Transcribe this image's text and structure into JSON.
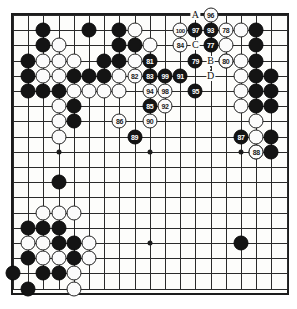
{
  "diagram": {
    "type": "go-board",
    "size": 19,
    "move_range": "67-100",
    "colors": {
      "black_stone": "#141414",
      "white_stone": "#fbfbfb",
      "grid_line": "#2a2a2a",
      "board_background": "#fdfdfb",
      "border": "#1c1c1c"
    }
  },
  "grid": {
    "origin_x": 13,
    "origin_y": 15,
    "spacing": 15.2,
    "star_points": [
      {
        "col": 3,
        "row": 3
      },
      {
        "col": 9,
        "row": 3
      },
      {
        "col": 15,
        "row": 3
      },
      {
        "col": 3,
        "row": 9
      },
      {
        "col": 9,
        "row": 9
      },
      {
        "col": 15,
        "row": 9
      },
      {
        "col": 3,
        "row": 15
      },
      {
        "col": 9,
        "row": 15
      },
      {
        "col": 15,
        "row": 15
      }
    ]
  },
  "stones": [
    {
      "col": 7,
      "row": 1,
      "color": "black"
    },
    {
      "col": 8,
      "row": 1,
      "color": "white"
    },
    {
      "col": 2,
      "row": 1,
      "color": "black"
    },
    {
      "col": 16,
      "row": 1,
      "color": "black"
    },
    {
      "col": 15,
      "row": 1,
      "color": "white"
    },
    {
      "col": 5,
      "row": 1,
      "color": "black"
    },
    {
      "col": 7,
      "row": 2,
      "color": "black"
    },
    {
      "col": 8,
      "row": 2,
      "color": "black"
    },
    {
      "col": 2,
      "row": 2,
      "color": "black"
    },
    {
      "col": 3,
      "row": 2,
      "color": "white"
    },
    {
      "col": 9,
      "row": 2,
      "color": "white"
    },
    {
      "col": 16,
      "row": 2,
      "color": "black"
    },
    {
      "col": 1,
      "row": 3,
      "color": "black"
    },
    {
      "col": 2,
      "row": 3,
      "color": "white"
    },
    {
      "col": 3,
      "row": 3,
      "color": "white"
    },
    {
      "col": 4,
      "row": 3,
      "color": "white"
    },
    {
      "col": 6,
      "row": 3,
      "color": "black"
    },
    {
      "col": 7,
      "row": 3,
      "color": "black"
    },
    {
      "col": 8,
      "row": 3,
      "color": "white"
    },
    {
      "col": 16,
      "row": 3,
      "color": "black"
    },
    {
      "col": 15,
      "row": 3,
      "color": "white"
    },
    {
      "col": 1,
      "row": 4,
      "color": "black"
    },
    {
      "col": 2,
      "row": 4,
      "color": "white"
    },
    {
      "col": 3,
      "row": 4,
      "color": "white"
    },
    {
      "col": 4,
      "row": 4,
      "color": "black"
    },
    {
      "col": 5,
      "row": 4,
      "color": "black"
    },
    {
      "col": 6,
      "row": 4,
      "color": "black"
    },
    {
      "col": 7,
      "row": 4,
      "color": "white"
    },
    {
      "col": 15,
      "row": 4,
      "color": "white"
    },
    {
      "col": 16,
      "row": 4,
      "color": "black"
    },
    {
      "col": 1,
      "row": 5,
      "color": "black"
    },
    {
      "col": 2,
      "row": 5,
      "color": "black"
    },
    {
      "col": 3,
      "row": 5,
      "color": "black"
    },
    {
      "col": 4,
      "row": 5,
      "color": "white"
    },
    {
      "col": 5,
      "row": 5,
      "color": "white"
    },
    {
      "col": 6,
      "row": 5,
      "color": "white"
    },
    {
      "col": 7,
      "row": 5,
      "color": "white"
    },
    {
      "col": 15,
      "row": 5,
      "color": "white"
    },
    {
      "col": 16,
      "row": 5,
      "color": "black"
    },
    {
      "col": 3,
      "row": 6,
      "color": "white"
    },
    {
      "col": 4,
      "row": 6,
      "color": "black"
    },
    {
      "col": 15,
      "row": 6,
      "color": "white"
    },
    {
      "col": 16,
      "row": 6,
      "color": "black"
    },
    {
      "col": 3,
      "row": 7,
      "color": "white"
    },
    {
      "col": 4,
      "row": 7,
      "color": "black"
    },
    {
      "col": 3,
      "row": 8,
      "color": "white"
    },
    {
      "col": 16,
      "row": 8,
      "color": "white"
    },
    {
      "col": 17,
      "row": 8,
      "color": "black"
    },
    {
      "col": 3,
      "row": 11,
      "color": "black"
    },
    {
      "col": 2,
      "row": 13,
      "color": "white"
    },
    {
      "col": 3,
      "row": 13,
      "color": "white"
    },
    {
      "col": 4,
      "row": 13,
      "color": "white"
    },
    {
      "col": 1,
      "row": 14,
      "color": "black"
    },
    {
      "col": 2,
      "row": 14,
      "color": "black"
    },
    {
      "col": 3,
      "row": 14,
      "color": "black"
    },
    {
      "col": 1,
      "row": 15,
      "color": "white"
    },
    {
      "col": 2,
      "row": 15,
      "color": "white"
    },
    {
      "col": 3,
      "row": 15,
      "color": "black"
    },
    {
      "col": 4,
      "row": 15,
      "color": "black"
    },
    {
      "col": 5,
      "row": 15,
      "color": "white"
    },
    {
      "col": 1,
      "row": 16,
      "color": "black"
    },
    {
      "col": 2,
      "row": 16,
      "color": "white"
    },
    {
      "col": 3,
      "row": 16,
      "color": "white"
    },
    {
      "col": 4,
      "row": 16,
      "color": "black"
    },
    {
      "col": 5,
      "row": 16,
      "color": "white"
    },
    {
      "col": 0,
      "row": 17,
      "color": "black"
    },
    {
      "col": 2,
      "row": 17,
      "color": "black"
    },
    {
      "col": 3,
      "row": 17,
      "color": "black"
    },
    {
      "col": 4,
      "row": 17,
      "color": "white"
    },
    {
      "col": 1,
      "row": 18,
      "color": "black"
    },
    {
      "col": 4,
      "row": 18,
      "color": "white"
    },
    {
      "col": 15,
      "row": 15,
      "color": "black"
    },
    {
      "col": 16,
      "row": 9,
      "color": "white"
    },
    {
      "col": 17,
      "row": 9,
      "color": "black"
    },
    {
      "col": 16,
      "row": 7,
      "color": "white"
    },
    {
      "col": 17,
      "row": 4,
      "color": "black"
    },
    {
      "col": 17,
      "row": 5,
      "color": "black"
    },
    {
      "col": 17,
      "row": 6,
      "color": "black"
    },
    {
      "col": 14,
      "row": 2,
      "color": "white"
    },
    {
      "col": 14,
      "row": 3,
      "color": "white"
    }
  ],
  "numbered_moves": [
    {
      "num": "96",
      "col": 13,
      "row": 0,
      "color": "white"
    },
    {
      "num": "100",
      "col": 11,
      "row": 1,
      "color": "white"
    },
    {
      "num": "97",
      "col": 12,
      "row": 1,
      "color": "black"
    },
    {
      "num": "93",
      "col": 13,
      "row": 1,
      "color": "black"
    },
    {
      "num": "78",
      "col": 14,
      "row": 1,
      "color": "white"
    },
    {
      "num": "84",
      "col": 11,
      "row": 2,
      "color": "white"
    },
    {
      "num": "77",
      "col": 13,
      "row": 2,
      "color": "black"
    },
    {
      "num": "81",
      "col": 9,
      "row": 3,
      "color": "black"
    },
    {
      "num": "79",
      "col": 12,
      "row": 3,
      "color": "black"
    },
    {
      "num": "80",
      "col": 14,
      "row": 3,
      "color": "white"
    },
    {
      "num": "82",
      "col": 8,
      "row": 4,
      "color": "white"
    },
    {
      "num": "83",
      "col": 9,
      "row": 4,
      "color": "black"
    },
    {
      "num": "99",
      "col": 10,
      "row": 4,
      "color": "black"
    },
    {
      "num": "91",
      "col": 11,
      "row": 4,
      "color": "black"
    },
    {
      "num": "94",
      "col": 9,
      "row": 5,
      "color": "white"
    },
    {
      "num": "98",
      "col": 10,
      "row": 5,
      "color": "white"
    },
    {
      "num": "95",
      "col": 12,
      "row": 5,
      "color": "black"
    },
    {
      "num": "85",
      "col": 9,
      "row": 6,
      "color": "black"
    },
    {
      "num": "92",
      "col": 10,
      "row": 6,
      "color": "white"
    },
    {
      "num": "86",
      "col": 7,
      "row": 7,
      "color": "white"
    },
    {
      "num": "90",
      "col": 9,
      "row": 7,
      "color": "white"
    },
    {
      "num": "89",
      "col": 8,
      "row": 8,
      "color": "black"
    },
    {
      "num": "87",
      "col": 15,
      "row": 8,
      "color": "black"
    },
    {
      "num": "88",
      "col": 16,
      "row": 9,
      "color": "white"
    }
  ],
  "letter_markers": [
    {
      "label": "A",
      "col": 12,
      "row": 0
    },
    {
      "label": "C",
      "col": 12,
      "row": 2
    },
    {
      "label": "B",
      "col": 13,
      "row": 3
    },
    {
      "label": "D",
      "col": 13,
      "row": 4
    }
  ],
  "dashed_connector": {
    "from": {
      "col": 13,
      "row": 3
    },
    "to": {
      "col": 13,
      "row": 4
    },
    "style": "dashed-vertical"
  }
}
